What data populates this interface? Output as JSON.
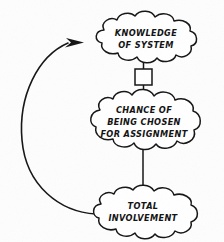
{
  "diagram": {
    "type": "causal-loop-diagram",
    "title": "",
    "background_color": "#fdfdfd",
    "line_color": "#151515",
    "nodes": [
      {
        "id": "knowledge",
        "shape": "cloud",
        "lines": [
          "KNOWLEDGE",
          "OF SYSTEM"
        ],
        "cx": 146,
        "cy": 40
      },
      {
        "id": "chance",
        "shape": "cloud",
        "lines": [
          "CHANCE OF",
          "BEING CHOSEN",
          "FOR ASSIGNMENT"
        ],
        "cx": 144,
        "cy": 122
      },
      {
        "id": "involvement",
        "shape": "cloud",
        "lines": [
          "TOTAL",
          "INVOLVEMENT"
        ],
        "cx": 143,
        "cy": 212
      }
    ],
    "box": {
      "id": "intermediate-box",
      "shape": "rectangle",
      "label": "",
      "x": 135,
      "y": 69,
      "width": 17,
      "height": 16
    },
    "edges": [
      {
        "id": "knowledge-to-box",
        "from": "knowledge",
        "to": "intermediate-box",
        "style": "straight",
        "arrow": false
      },
      {
        "id": "box-to-chance",
        "from": "intermediate-box",
        "to": "chance",
        "style": "straight",
        "arrow": true
      },
      {
        "id": "chance-to-involvement",
        "from": "chance",
        "to": "involvement",
        "style": "straight",
        "arrow": true
      },
      {
        "id": "involvement-to-knowledge",
        "from": "involvement",
        "to": "knowledge",
        "style": "curved-feedback-loop",
        "arrow": true
      }
    ]
  }
}
